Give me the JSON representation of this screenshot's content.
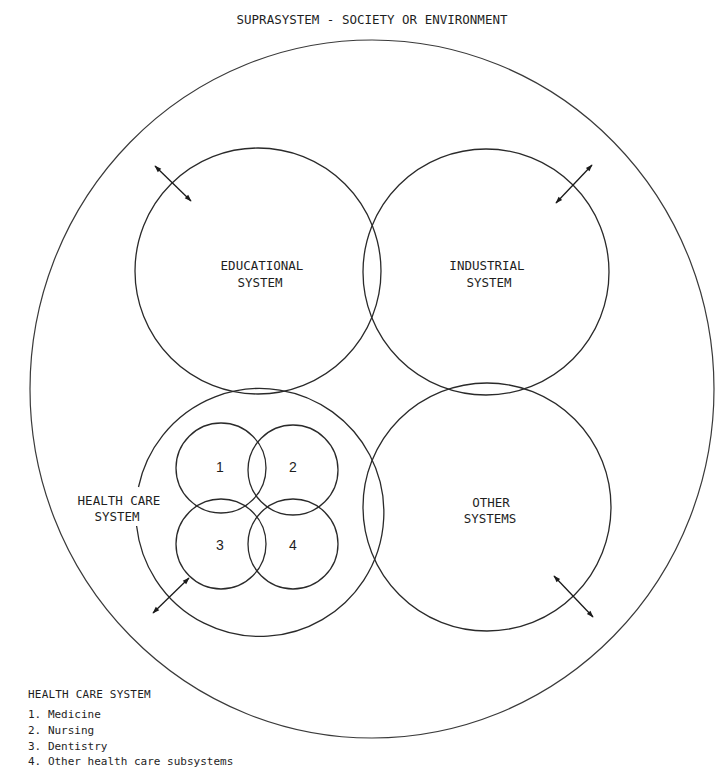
{
  "title": "SUPRASYSTEM - SOCIETY OR ENVIRONMENT",
  "systems": [
    {
      "id": "educational",
      "line1": "EDUCATIONAL",
      "line2": "SYSTEM"
    },
    {
      "id": "industrial",
      "line1": "INDUSTRIAL",
      "line2": "SYSTEM"
    },
    {
      "id": "health-care",
      "line1": "HEALTH CARE",
      "line2": "SYSTEM"
    },
    {
      "id": "other",
      "line1": "OTHER",
      "line2": "SYSTEMS"
    }
  ],
  "subsystems": [
    {
      "number": "1"
    },
    {
      "number": "2"
    },
    {
      "number": "3"
    },
    {
      "number": "4"
    }
  ],
  "legend": {
    "title": "HEALTH CARE SYSTEM",
    "items": [
      {
        "number": "1.",
        "label": "Medicine"
      },
      {
        "number": "2.",
        "label": "Nursing"
      },
      {
        "number": "3.",
        "label": "Dentistry"
      },
      {
        "number": "4.",
        "label": "Other health care subsystems"
      }
    ]
  },
  "arrows": {
    "style": "double-headed",
    "count": 4,
    "meaning": "interaction between system and suprasystem"
  },
  "colors": {
    "background": "#ffffff",
    "line": "#2a2a2a",
    "text": "#1e1e1e"
  }
}
